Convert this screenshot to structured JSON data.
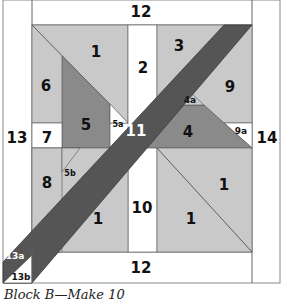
{
  "caption": "Block B—Make 10",
  "colors": {
    "light": "#c9c9c9",
    "medium": "#8a8a8a",
    "dark": "#555555",
    "white": "#ffffff",
    "line": "#666666"
  },
  "labels": {
    "p12_top": "12",
    "p1_top": "1",
    "p2": "2",
    "p3": "3",
    "p6": "6",
    "p9": "9",
    "p4a": "4a",
    "p5": "5",
    "p5a": "5a",
    "p11": "11",
    "p4": "4",
    "p9a": "9a",
    "p13": "13",
    "p14": "14",
    "p7": "7",
    "p8": "8",
    "p5b": "5b",
    "p1_right": "1",
    "p10": "10",
    "p1_bl": "1",
    "p1_br": "1",
    "p13a": "13a",
    "p13b": "13b",
    "p12_bottom": "12"
  }
}
